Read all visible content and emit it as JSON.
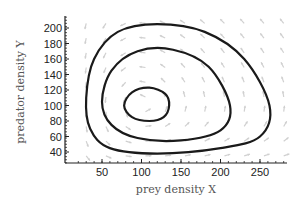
{
  "chart_data": {
    "type": "line",
    "title": "",
    "xlabel": "prey density X",
    "ylabel": "predator density Y",
    "xlim": [
      20,
      285
    ],
    "ylim": [
      28,
      210
    ],
    "x_ticks": [
      50,
      100,
      150,
      200,
      250
    ],
    "y_ticks": [
      40,
      60,
      80,
      100,
      120,
      140,
      160,
      180,
      200
    ],
    "grid": false,
    "legend": null,
    "background": "direction field (light gray arrows)",
    "series": [
      {
        "name": "orbit-outer",
        "color": "#1a1a1a",
        "points": [
          [
            30,
            110
          ],
          [
            40,
            160
          ],
          [
            70,
            195
          ],
          [
            120,
            205
          ],
          [
            180,
            195
          ],
          [
            230,
            160
          ],
          [
            262,
            100
          ],
          [
            250,
            60
          ],
          [
            200,
            45
          ],
          [
            120,
            38
          ],
          [
            60,
            45
          ],
          [
            35,
            70
          ],
          [
            30,
            110
          ]
        ]
      },
      {
        "name": "orbit-middle",
        "color": "#1a1a1a",
        "points": [
          [
            50,
            105
          ],
          [
            62,
            145
          ],
          [
            95,
            170
          ],
          [
            140,
            172
          ],
          [
            185,
            150
          ],
          [
            212,
            100
          ],
          [
            200,
            68
          ],
          [
            150,
            55
          ],
          [
            95,
            58
          ],
          [
            62,
            75
          ],
          [
            50,
            105
          ]
        ]
      },
      {
        "name": "orbit-inner",
        "color": "#1a1a1a",
        "points": [
          [
            78,
            100
          ],
          [
            88,
            117
          ],
          [
            110,
            123
          ],
          [
            130,
            115
          ],
          [
            135,
            100
          ],
          [
            128,
            85
          ],
          [
            110,
            80
          ],
          [
            88,
            85
          ],
          [
            78,
            100
          ]
        ]
      }
    ],
    "equilibrium": [
      100,
      100
    ]
  }
}
